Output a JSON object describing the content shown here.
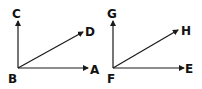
{
  "diagram": {
    "type": "angle-pair",
    "colors": {
      "stroke": "#1a1a1a",
      "text": "#111111",
      "background": "#ffffff"
    },
    "figures": [
      {
        "name": "left-angle-figure",
        "vertex": {
          "label": "B",
          "x": 18,
          "y": 68,
          "label_x": 8,
          "label_y": 83
        },
        "rays": [
          {
            "label": "C",
            "to_x": 18,
            "to_y": 21,
            "label_x": 12,
            "label_y": 18
          },
          {
            "label": "D",
            "to_x": 83,
            "to_y": 32,
            "label_x": 85,
            "label_y": 36
          },
          {
            "label": "A",
            "to_x": 88,
            "to_y": 68,
            "label_x": 90,
            "label_y": 74
          }
        ]
      },
      {
        "name": "right-angle-figure",
        "vertex": {
          "label": "F",
          "x": 113,
          "y": 68,
          "label_x": 107,
          "label_y": 83
        },
        "rays": [
          {
            "label": "G",
            "to_x": 113,
            "to_y": 21,
            "label_x": 107,
            "label_y": 18
          },
          {
            "label": "H",
            "to_x": 178,
            "to_y": 30,
            "label_x": 181,
            "label_y": 35
          },
          {
            "label": "E",
            "to_x": 184,
            "to_y": 68,
            "label_x": 185,
            "label_y": 73
          }
        ]
      }
    ]
  }
}
